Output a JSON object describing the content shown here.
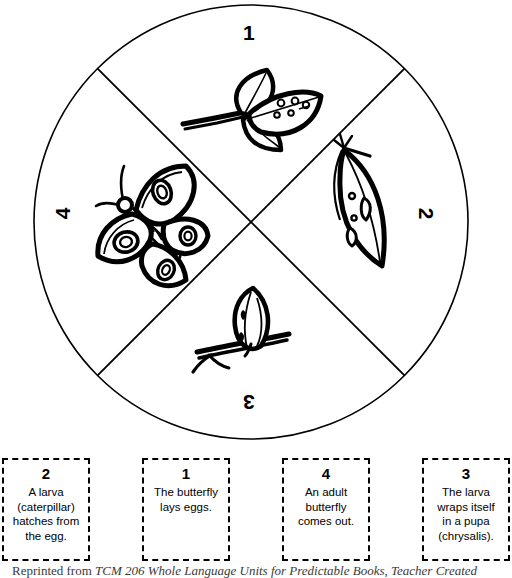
{
  "wheel": {
    "title": "Butterfly Life Cycle Spinner Wheel",
    "center": {
      "x": 251,
      "y": 222
    },
    "radius": 219,
    "stroke_color": "#000000",
    "fill_color": "#ffffff",
    "quadrants": [
      {
        "number": "1",
        "position": "top",
        "rotation_deg": 0,
        "illustration": "leaf-sprig-with-eggs-icon",
        "illustration_label": "Leaves with butterfly eggs"
      },
      {
        "number": "2",
        "position": "right",
        "rotation_deg": 90,
        "illustration": "chrysalis-icon",
        "illustration_label": "Chrysalis hanging from a twig"
      },
      {
        "number": "3",
        "position": "bottom",
        "rotation_deg": 180,
        "illustration": "cocoon-on-twig-icon",
        "illustration_label": "Pupa wrapped on a twig"
      },
      {
        "number": "4",
        "position": "left",
        "rotation_deg": 270,
        "illustration": "butterfly-icon",
        "illustration_label": "Adult butterfly"
      }
    ]
  },
  "cards": [
    {
      "number": "2",
      "text": "A larva\n(caterpillar)\nhatches from\nthe egg."
    },
    {
      "number": "1",
      "text": "The butterfly\nlays eggs."
    },
    {
      "number": "4",
      "text": "An adult\nbutterfly\ncomes out."
    },
    {
      "number": "3",
      "text": "The larva\nwraps itself\nin a pupa\n(chrysalis)."
    }
  ],
  "footer": {
    "prefix": "Reprinted from ",
    "source": "TCM 206 Whole Language Units for Predictable Books",
    "separator": ", ",
    "publisher": "Teacher Created"
  }
}
